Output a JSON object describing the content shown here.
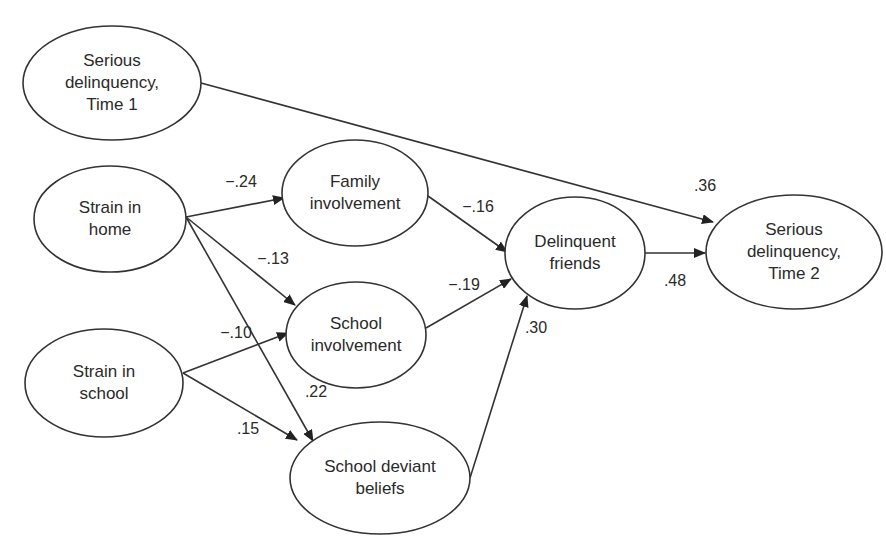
{
  "diagram": {
    "type": "path-diagram",
    "colors": {
      "stroke": "#333333",
      "text": "#2a2a2a",
      "background": "#ffffff"
    },
    "nodes": [
      {
        "id": "sd1",
        "lines": [
          "Serious",
          "delinquency,",
          "Time 1"
        ],
        "cx": 112,
        "cy": 83,
        "rx": 89,
        "ry": 57
      },
      {
        "id": "sh",
        "lines": [
          "Strain in",
          "home"
        ],
        "cx": 110,
        "cy": 219,
        "rx": 76,
        "ry": 53
      },
      {
        "id": "ss",
        "lines": [
          "Strain in",
          "school"
        ],
        "cx": 104,
        "cy": 383,
        "rx": 79,
        "ry": 54
      },
      {
        "id": "fi",
        "lines": [
          "Family",
          "involvement"
        ],
        "cx": 355,
        "cy": 193,
        "rx": 73,
        "ry": 53
      },
      {
        "id": "si",
        "lines": [
          "School",
          "involvement"
        ],
        "cx": 356,
        "cy": 335,
        "rx": 70,
        "ry": 53
      },
      {
        "id": "sdb",
        "lines": [
          "School deviant",
          "beliefs"
        ],
        "cx": 380,
        "cy": 478,
        "rx": 90,
        "ry": 56
      },
      {
        "id": "df",
        "lines": [
          "Delinquent",
          "friends"
        ],
        "cx": 575,
        "cy": 253,
        "rx": 70,
        "ry": 56
      },
      {
        "id": "sd2",
        "lines": [
          "Serious",
          "delinquency,",
          "Time 2"
        ],
        "cx": 794,
        "cy": 252,
        "rx": 88,
        "ry": 57
      }
    ],
    "edges": [
      {
        "from": "sd1",
        "to": "sd2",
        "coef": ".36",
        "x1": 201,
        "y1": 83,
        "x2": 713,
        "y2": 222,
        "lx": 705,
        "ly": 186
      },
      {
        "from": "sh",
        "to": "fi",
        "coef": "−.24",
        "x1": 186,
        "y1": 217,
        "x2": 284,
        "y2": 198,
        "lx": 241,
        "ly": 182
      },
      {
        "from": "sh",
        "to": "si",
        "coef": "−.13",
        "x1": 186,
        "y1": 217,
        "x2": 295,
        "y2": 305,
        "lx": 273,
        "ly": 259
      },
      {
        "from": "sh",
        "to": "sdb",
        "coef": ".22",
        "x1": 186,
        "y1": 217,
        "x2": 313,
        "y2": 441,
        "lx": 316,
        "ly": 392
      },
      {
        "from": "ss",
        "to": "si",
        "coef": "−.10",
        "x1": 183,
        "y1": 373,
        "x2": 288,
        "y2": 333,
        "lx": 236,
        "ly": 333
      },
      {
        "from": "ss",
        "to": "sdb",
        "coef": ".15",
        "x1": 183,
        "y1": 373,
        "x2": 297,
        "y2": 440,
        "lx": 248,
        "ly": 429
      },
      {
        "from": "fi",
        "to": "df",
        "coef": "−.16",
        "x1": 428,
        "y1": 196,
        "x2": 507,
        "y2": 252,
        "lx": 478,
        "ly": 207
      },
      {
        "from": "si",
        "to": "df",
        "coef": "−.19",
        "x1": 426,
        "y1": 328,
        "x2": 511,
        "y2": 279,
        "lx": 464,
        "ly": 285
      },
      {
        "from": "sdb",
        "to": "df",
        "coef": ".30",
        "x1": 470,
        "y1": 478,
        "x2": 527,
        "y2": 296,
        "lx": 536,
        "ly": 328
      },
      {
        "from": "df",
        "to": "sd2",
        "coef": ".48",
        "x1": 645,
        "y1": 253,
        "x2": 705,
        "y2": 253,
        "lx": 675,
        "ly": 281
      }
    ]
  }
}
